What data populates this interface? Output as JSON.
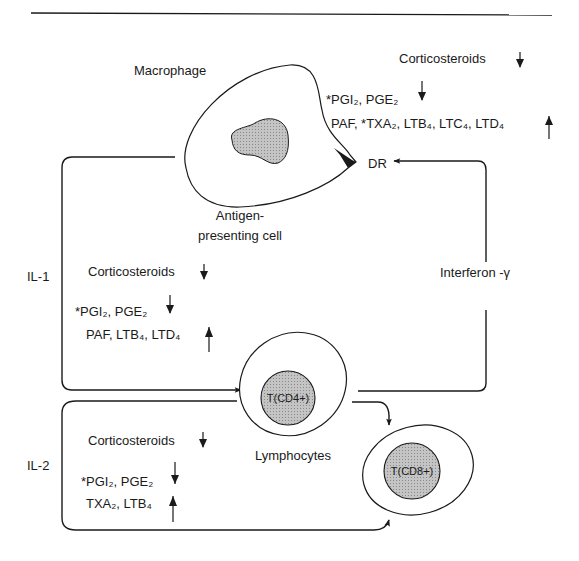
{
  "diagram": {
    "top_rule": true,
    "cells": {
      "macrophage": {
        "title": "Macrophage",
        "subtitle_line1": "Antigen-",
        "subtitle_line2": "presenting cell",
        "receptor": "DR"
      },
      "t_cd4": {
        "label": "T(CD4+)"
      },
      "t_cd8": {
        "label": "T(CD8+)"
      },
      "lymphocytes_label": "Lymphocytes"
    },
    "signals": {
      "il1": "IL-1",
      "il2": "IL-2",
      "interferon": "Interferon -γ"
    },
    "groups": {
      "macrophage_group": {
        "corticosteroids": "Corticosteroids",
        "corticosteroids_dir": "down",
        "line1": "*PGI₂, PGE₂",
        "line1_dir": "down",
        "line2": "PAF, *TXA₂, LTB₄, LTC₄, LTD₄",
        "line2_dir": "up"
      },
      "il1_group": {
        "corticosteroids": "Corticosteroids",
        "corticosteroids_dir": "down",
        "line1": "*PGI₂, PGE₂",
        "line1_dir": "down",
        "line2": "PAF, LTB₄, LTD₄",
        "line2_dir": "up"
      },
      "il2_group": {
        "corticosteroids": "Corticosteroids",
        "corticosteroids_dir": "down",
        "line1": "*PGI₂, PGE₂",
        "line1_dir": "down",
        "line2": "TXA₂, LTB₄",
        "line2_dir": "up"
      }
    },
    "colors": {
      "stroke": "#1a1a1a",
      "nucleus_fill": "#b8b8b8",
      "background": "#ffffff"
    }
  }
}
